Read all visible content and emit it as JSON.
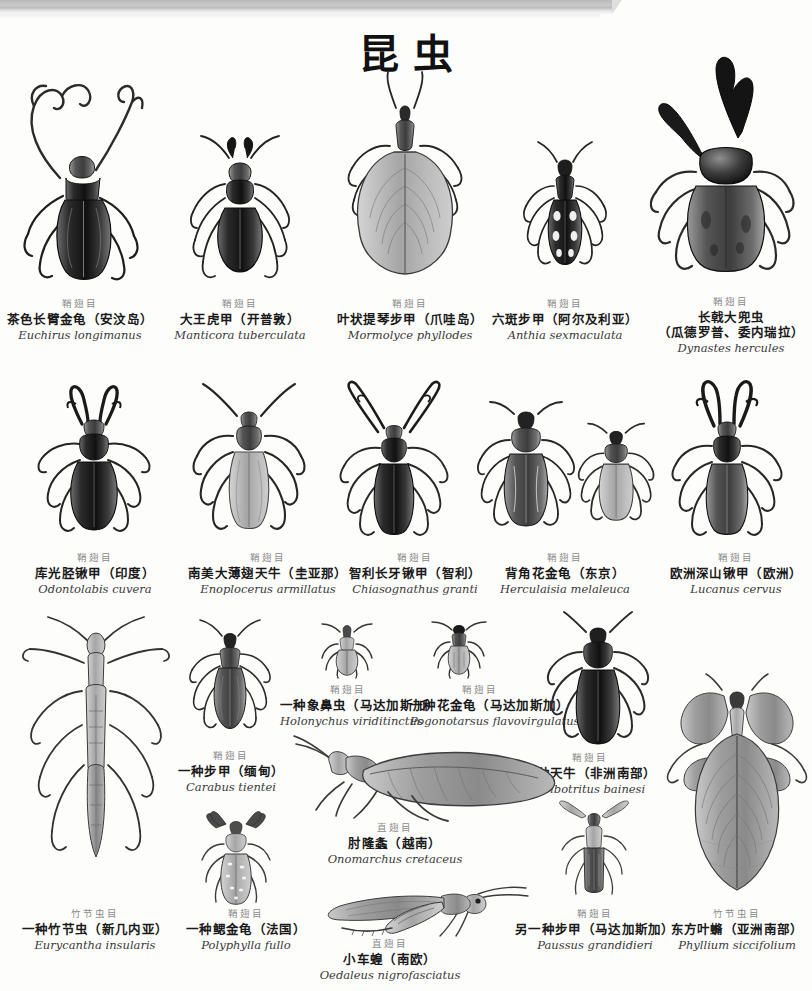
{
  "page": {
    "title": "昆虫",
    "background_color": "#fdfdfb",
    "scan_bar_color": "#c3c3c3"
  },
  "orders": {
    "coleoptera": "鞘翅目",
    "orthoptera": "直翅目",
    "phasmatodea": "竹节虫目"
  },
  "specimens": [
    {
      "id": "euchirus-longimanus",
      "order": "鞘翅目",
      "cn": "茶色长臂金龟（安汶岛）",
      "la": "Euchirus longimanus"
    },
    {
      "id": "manticora-tuberculata",
      "order": "鞘翅目",
      "cn": "大王虎甲（开普敦）",
      "la": "Manticora tuberculata"
    },
    {
      "id": "mormolyce-phyllodes",
      "order": "鞘翅目",
      "cn": "叶状提琴步甲（爪哇岛）",
      "la": "Mormolyce phyllodes"
    },
    {
      "id": "anthia-sexmaculata",
      "order": "鞘翅目",
      "cn": "六斑步甲（阿尔及利亚）",
      "la": "Anthia sexmaculata"
    },
    {
      "id": "dynastes-hercules",
      "order": "鞘翅目",
      "cn": "长戟大兜虫",
      "cn2": "（瓜德罗普、委内瑞拉）",
      "la": "Dynastes hercules"
    },
    {
      "id": "odontolabis-cuvera",
      "order": "鞘翅目",
      "cn": "库光胫锹甲（印度）",
      "la": "Odontolabis cuvera"
    },
    {
      "id": "enoplocerus-armillatus",
      "order": "鞘翅目",
      "cn": "南美大薄翅天牛（圭亚那）",
      "la": "Enoplocerus armillatus"
    },
    {
      "id": "chiasognathus-granti",
      "order": "鞘翅目",
      "cn": "智利长牙锹甲（智利）",
      "la": "Chiasognathus granti"
    },
    {
      "id": "herculaisia-melaleuca",
      "order": "鞘翅目",
      "cn": "背角花金龟（东京）",
      "la": "Herculaisia melaleuca"
    },
    {
      "id": "lucanus-cervus",
      "order": "鞘翅目",
      "cn": "欧洲深山锹甲（欧洲）",
      "la": "Lucanus cervus"
    },
    {
      "id": "holonychus-viriditinctus",
      "order": "鞘翅目",
      "cn": "一种象鼻虫（马达加斯加）",
      "la": "Holonychus viriditinctus"
    },
    {
      "id": "pogonotarsus-flavovirgulatus",
      "order": "鞘翅目",
      "cn": "一种花金龟（马达加斯加）",
      "la": "Pogonotarsus flavovirgulatus"
    },
    {
      "id": "carabus-tientei",
      "order": "鞘翅目",
      "cn": "一种步甲（缅甸）",
      "la": "Carabus tientei"
    },
    {
      "id": "bolbotritus-bainesi",
      "order": "鞘翅目",
      "cn": "一种天牛（非洲南部）",
      "la": "Bolbotritus bainesi"
    },
    {
      "id": "onomarchus-cretaceus",
      "order": "直翅目",
      "cn": "肘隆螽（越南）",
      "la": "Onomarchus cretaceus"
    },
    {
      "id": "eurycantha-insularis",
      "order": "竹节虫目",
      "cn": "一种竹节虫（新几内亚）",
      "la": "Eurycantha insularis"
    },
    {
      "id": "polyphylla-fullo",
      "order": "鞘翅目",
      "cn": "一种鳃金龟（法国）",
      "la": "Polyphylla fullo"
    },
    {
      "id": "oedaleus-nigrofasciatus",
      "order": "直翅目",
      "cn": "小车蝗（南欧）",
      "la": "Oedaleus nigrofasciatus"
    },
    {
      "id": "paussus-grandidieri",
      "order": "鞘翅目",
      "cn": "另一种步甲（马达加斯加）",
      "la": "Paussus grandidieri"
    },
    {
      "id": "phyllium-siccifolium",
      "order": "竹节虫目",
      "cn": "东方叶䗛（亚洲南部）",
      "la": "Phyllium siccifolium"
    }
  ]
}
